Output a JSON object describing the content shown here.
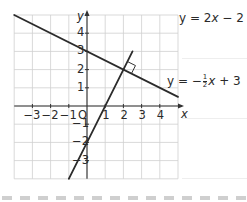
{
  "chart_data": {
    "type": "line",
    "title": "",
    "xlabel": "x",
    "ylabel": "y",
    "xlim": [
      -4,
      5
    ],
    "ylim": [
      -4,
      5
    ],
    "grid": true,
    "x_ticks": [
      "-3",
      "-2",
      "-1",
      "1",
      "2",
      "3",
      "4"
    ],
    "y_ticks": [
      "4",
      "3",
      "2",
      "1",
      "-1",
      "-2",
      "-3"
    ],
    "origin_label": "O",
    "series": [
      {
        "name": "y = 2x - 2",
        "slope": 2,
        "intercept": -2,
        "x": [
          -1,
          2.5
        ],
        "y": [
          -4,
          3
        ]
      },
      {
        "name": "y = -1/2 x + 3",
        "slope": -0.5,
        "intercept": 3,
        "x": [
          -4,
          5
        ],
        "y": [
          5,
          0.5
        ]
      }
    ],
    "annotations": [
      {
        "type": "right-angle-marker",
        "at": [
          2,
          2
        ],
        "text": "intersection (2, 2), perpendicular lines"
      }
    ],
    "legend": {
      "line1": {
        "prefix": "y = 2",
        "var": "x",
        "suffix": " − 2"
      },
      "line2": {
        "prefix": "y = −",
        "num": "1",
        "den": "2",
        "var": "x",
        "suffix": " + 3"
      }
    }
  },
  "axes": {
    "x_label": "x",
    "y_label": "y",
    "origin": "O",
    "x_tick_labels": [
      "−3",
      "−2",
      "−1",
      "1",
      "2",
      "3",
      "4"
    ],
    "y_tick_labels": [
      "4",
      "3",
      "2",
      "1",
      "−1",
      "−2",
      "−3"
    ]
  }
}
